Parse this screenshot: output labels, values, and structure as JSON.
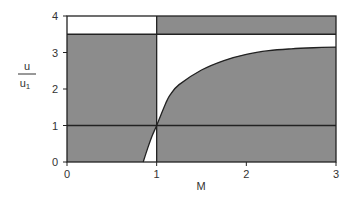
{
  "chart_data": {
    "type": "area",
    "title": "",
    "xlabel": "M",
    "ylabel_numerator": "u",
    "ylabel_denominator": "u",
    "ylabel_denominator_subscript": "1",
    "xlim": [
      0,
      3
    ],
    "ylim": [
      0,
      4
    ],
    "xticks": [
      "0",
      "1",
      "2",
      "3"
    ],
    "yticks": [
      "0",
      "1",
      "2",
      "3",
      "4"
    ],
    "grid": false,
    "legend": null,
    "colors": {
      "shade": "#8c8c8c",
      "line": "#222222",
      "background": "#ffffff"
    },
    "reference_lines": [
      {
        "orientation": "horizontal",
        "value": 1
      },
      {
        "orientation": "horizontal",
        "value": 3.5
      },
      {
        "orientation": "vertical",
        "value": 1
      }
    ],
    "shaded_regions": [
      {
        "name": "left-lower-shaded",
        "M": [
          0,
          1
        ],
        "u": [
          0,
          3.5
        ],
        "note": "shaded except below curve branch near M 0.85-1"
      },
      {
        "name": "left-top-white",
        "M": [
          0,
          1
        ],
        "u": [
          3.5,
          4
        ]
      },
      {
        "name": "right-top-shaded",
        "M": [
          1,
          3
        ],
        "u": [
          3.5,
          4
        ]
      },
      {
        "name": "right-under-curve-shaded",
        "M": [
          1,
          3
        ],
        "u": "0 to curve"
      },
      {
        "name": "right-above-curve-white",
        "M": [
          1,
          3
        ],
        "u": "curve to 3.5"
      }
    ],
    "series": [
      {
        "name": "u/u1 curve",
        "x": [
          0.85,
          0.9,
          0.95,
          1.0,
          1.1,
          1.15,
          1.25,
          1.5,
          1.75,
          2.0,
          2.25,
          2.5,
          2.75,
          3.0
        ],
        "y": [
          0.0,
          0.38,
          0.72,
          1.0,
          1.6,
          1.84,
          2.12,
          2.52,
          2.78,
          2.95,
          3.05,
          3.1,
          3.13,
          3.15
        ]
      }
    ]
  }
}
